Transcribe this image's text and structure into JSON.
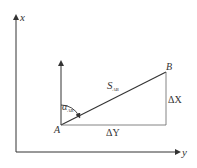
{
  "diagram": {
    "axes": {
      "vertical_label": "x",
      "horizontal_label": "y"
    },
    "points": {
      "A": "A",
      "B": "B"
    },
    "segment_label_main": "S",
    "segment_label_sub": "AB",
    "angle_label_main": "α",
    "angle_label_sub": "AB",
    "delta_x_label": "ΔX",
    "delta_y_label": "ΔY",
    "colors": {
      "line": "#333333",
      "background": "#ffffff"
    }
  }
}
